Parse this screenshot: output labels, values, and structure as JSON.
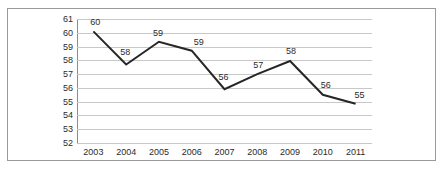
{
  "chart_data": {
    "type": "line",
    "title": "",
    "subtitle": "",
    "xlabel": "",
    "ylabel": "",
    "categories": [
      "2003",
      "2004",
      "2005",
      "2006",
      "2007",
      "2008",
      "2009",
      "2010",
      "2011"
    ],
    "values": [
      60.1,
      57.7,
      59.35,
      58.7,
      55.9,
      57.0,
      57.95,
      55.5,
      54.85
    ],
    "point_labels": [
      "60",
      "58",
      "59",
      "59",
      "56",
      "57",
      "58",
      "56",
      "55"
    ],
    "series": [
      {
        "name": "",
        "values": [
          60.1,
          57.7,
          59.35,
          58.7,
          55.9,
          57.0,
          57.95,
          55.5,
          54.85
        ],
        "labels": [
          "60",
          "58",
          "59",
          "59",
          "56",
          "57",
          "58",
          "56",
          "55"
        ],
        "color": "#262626"
      }
    ],
    "ylim": [
      52,
      61
    ],
    "y_ticks": [
      "61",
      "60",
      "59",
      "58",
      "57",
      "56",
      "55",
      "54",
      "53",
      "52"
    ],
    "grid": true,
    "grid_color": "#c8c8c8",
    "legend": "none",
    "markers": "none",
    "line_color": "#262626",
    "background": "#ffffff",
    "border_color": "#9a9a9a",
    "axis_color": "#8c8c8c",
    "text_color": "#2b2b2b"
  }
}
